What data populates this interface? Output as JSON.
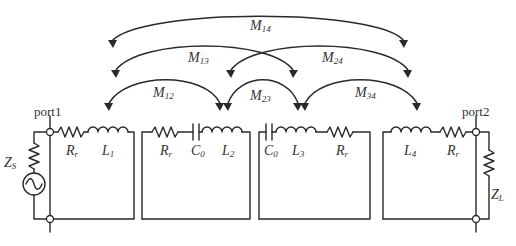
{
  "diagram": {
    "type": "coupled-resonator equivalent circuit",
    "ports": [
      {
        "id": "port1",
        "label": "port1"
      },
      {
        "id": "port2",
        "label": "port2"
      }
    ],
    "source": {
      "label": "Z",
      "sub": "S"
    },
    "load": {
      "label": "Z",
      "sub": "L"
    },
    "resonators": [
      {
        "id": "r1",
        "components": [
          {
            "type": "resistor",
            "label": "R",
            "sub": "r"
          },
          {
            "type": "inductor",
            "label": "L",
            "sub": "1"
          }
        ]
      },
      {
        "id": "r2",
        "components": [
          {
            "type": "resistor",
            "label": "R",
            "sub": "r"
          },
          {
            "type": "capacitor",
            "label": "C",
            "sub": "0"
          },
          {
            "type": "inductor",
            "label": "L",
            "sub": "2"
          }
        ]
      },
      {
        "id": "r3",
        "components": [
          {
            "type": "capacitor",
            "label": "C",
            "sub": "0"
          },
          {
            "type": "inductor",
            "label": "L",
            "sub": "3"
          },
          {
            "type": "resistor",
            "label": "R",
            "sub": "r"
          }
        ]
      },
      {
        "id": "r4",
        "components": [
          {
            "type": "inductor",
            "label": "L",
            "sub": "4"
          },
          {
            "type": "resistor",
            "label": "R",
            "sub": "r"
          }
        ]
      }
    ],
    "couplings": [
      {
        "label": "M",
        "sub": "14",
        "from": "L1",
        "to": "L4"
      },
      {
        "label": "M",
        "sub": "13",
        "from": "L1",
        "to": "L3"
      },
      {
        "label": "M",
        "sub": "24",
        "from": "L2",
        "to": "L4"
      },
      {
        "label": "M",
        "sub": "12",
        "from": "L1",
        "to": "L2"
      },
      {
        "label": "M",
        "sub": "23",
        "from": "L2",
        "to": "L3"
      },
      {
        "label": "M",
        "sub": "34",
        "from": "L3",
        "to": "L4"
      }
    ],
    "colors": {
      "stroke": "#2a2a2a",
      "text": "#333333",
      "background": "#ffffff"
    }
  }
}
